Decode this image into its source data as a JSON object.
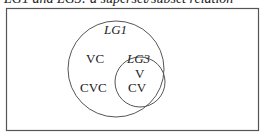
{
  "caption": "LG1 and LG3: a superset/subset relation",
  "diagram": {
    "outer_set": {
      "label": "LG1",
      "members": [
        "VC",
        "CVC"
      ]
    },
    "inner_set": {
      "label": "LG3",
      "members": [
        "V",
        "CV"
      ]
    }
  }
}
